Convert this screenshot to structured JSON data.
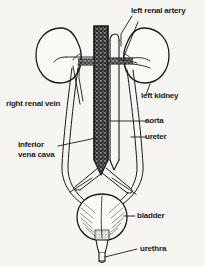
{
  "figure": {
    "background_color": "#f6f5f2",
    "ink_color": "#1a1a1a",
    "width": 205,
    "height": 267
  },
  "labels": {
    "left_renal_artery": "left renal artery",
    "left_kidney": "left kidney",
    "right_renal_vein": "right renal vein",
    "inferior_vena_cava_line1": "inferior",
    "inferior_vena_cava_line2": "vena cava",
    "aorta": "aorta",
    "ureter": "ureter",
    "bladder": "bladder",
    "urethra": "urethra"
  },
  "structures": [
    {
      "name": "right-kidney",
      "label_shown": false
    },
    {
      "name": "left-kidney",
      "label_shown": true
    },
    {
      "name": "aorta",
      "label_shown": true
    },
    {
      "name": "inferior-vena-cava",
      "label_shown": true
    },
    {
      "name": "left-renal-artery",
      "label_shown": true
    },
    {
      "name": "right-renal-vein",
      "label_shown": true
    },
    {
      "name": "left-ureter",
      "label_shown": true
    },
    {
      "name": "right-ureter",
      "label_shown": false
    },
    {
      "name": "bladder",
      "label_shown": true
    },
    {
      "name": "urethra",
      "label_shown": true
    },
    {
      "name": "iliac-vessels",
      "label_shown": false
    }
  ]
}
